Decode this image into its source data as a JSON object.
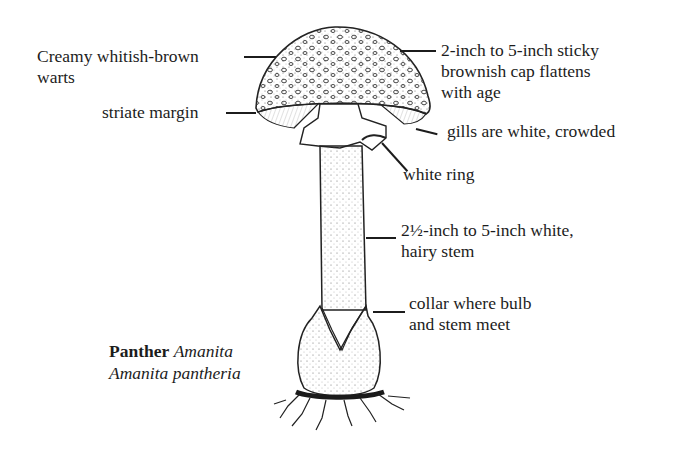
{
  "diagram": {
    "title": {
      "common_name_bold": "Panther",
      "common_name_italic": "Amanita",
      "scientific_name": "Amanita pantheria"
    },
    "labels": [
      {
        "id": "warts",
        "line1": "Creamy whitish-brown",
        "line2": "warts"
      },
      {
        "id": "margin",
        "line1": "striate margin"
      },
      {
        "id": "cap",
        "line1": "2-inch to 5-inch sticky",
        "line2": "brownish cap flattens",
        "line3": "with age"
      },
      {
        "id": "gills",
        "line1": "gills are white, crowded"
      },
      {
        "id": "ring",
        "line1": "white ring"
      },
      {
        "id": "stem",
        "line1": "2½-inch to 5-inch white,",
        "line2": "hairy stem"
      },
      {
        "id": "collar",
        "line1": "collar where bulb",
        "line2": "and stem meet"
      }
    ],
    "colors": {
      "ink": "#1c1c1c",
      "background": "#ffffff"
    }
  }
}
